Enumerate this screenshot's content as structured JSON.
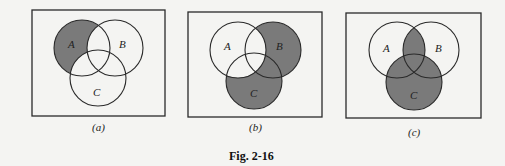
{
  "figure": {
    "title": "Fig. 2-16",
    "shade_color": "#7a7a7a",
    "line_color": "#2a2a2a",
    "background": "#f4f4f2"
  },
  "panels": [
    {
      "caption": "(a)",
      "shaded_region": "A − (B ∪ C)",
      "labels": {
        "A": "A",
        "B": "B",
        "C": "C"
      }
    },
    {
      "caption": "(b)",
      "shaded_region": "(B ∪ C) − A",
      "labels": {
        "A": "A",
        "B": "B",
        "C": "C"
      }
    },
    {
      "caption": "(c)",
      "shaded_region": "(A ∩ B) ∪ C",
      "labels": {
        "A": "A",
        "B": "B",
        "C": "C"
      }
    }
  ]
}
